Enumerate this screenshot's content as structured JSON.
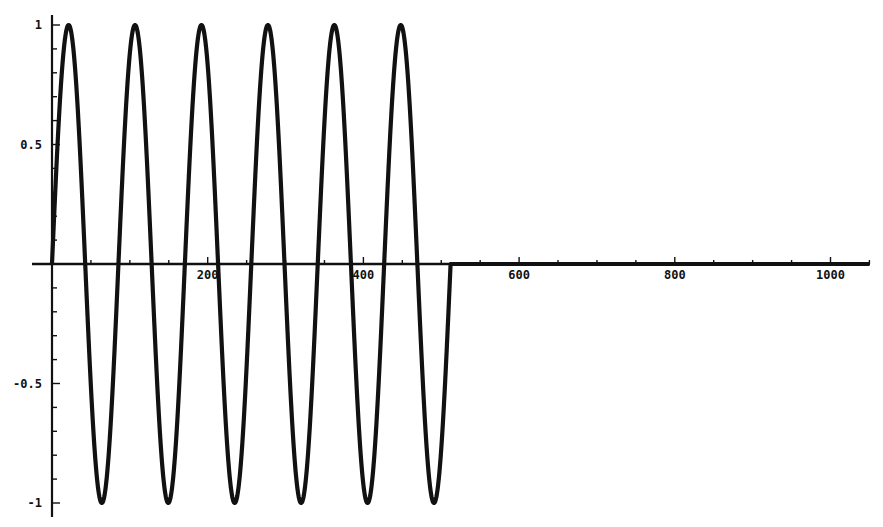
{
  "chart_data": {
    "type": "line",
    "title": "",
    "xlabel": "",
    "ylabel": "",
    "xlim": [
      0,
      1050
    ],
    "ylim": [
      -1,
      1
    ],
    "grid": false,
    "legend": null,
    "x_ticks": [
      200,
      400,
      600,
      800,
      1000
    ],
    "x_tick_labels": [
      "200",
      "400",
      "600",
      "800",
      "1000"
    ],
    "y_ticks": [
      1,
      0.5,
      -0.5,
      -1
    ],
    "y_tick_labels": [
      "1",
      "0.5",
      "-0.5",
      "-1"
    ],
    "series": [
      {
        "name": "signal",
        "description": "sine burst: y = sin(2*pi*6*x/512) for 0<=x<=512, y = 0 for x>512",
        "cycles": 6,
        "burst_end": 512,
        "period": 85.33,
        "amplitude": 1,
        "x_end": 1050,
        "peaks_x": [
          21,
          107,
          192,
          277,
          363,
          448
        ],
        "troughs_x": [
          64,
          149,
          235,
          320,
          405,
          491
        ],
        "color": "#111111"
      }
    ]
  }
}
